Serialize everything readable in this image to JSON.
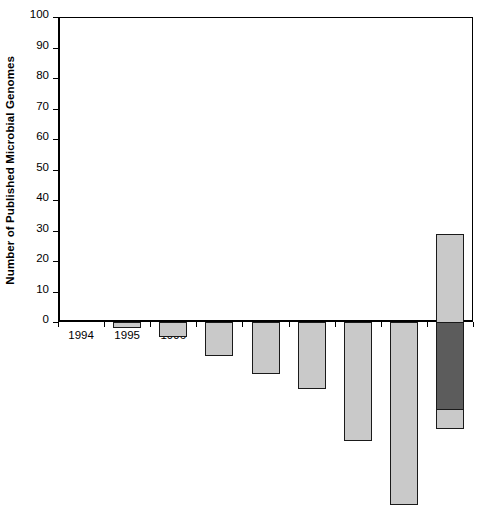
{
  "chart_data": {
    "type": "bar",
    "title": "",
    "subtitle": "",
    "xlabel": "",
    "ylabel": "Number of Published Microbial Genomes",
    "categories": [
      "1994",
      "1995",
      "1996",
      "1997",
      "1998",
      "1999",
      "2000",
      "2001",
      "2002"
    ],
    "values": [
      0,
      2,
      5,
      11,
      17,
      22,
      39,
      60,
      93
    ],
    "stacked": true,
    "series": [
      {
        "name": "lower-segment",
        "color": "#c9c9c9",
        "values": [
          0,
          2,
          5,
          11,
          17,
          22,
          39,
          60,
          64
        ]
      },
      {
        "name": "upper-segment",
        "color": "#5c5c5c",
        "values": [
          0,
          0,
          0,
          0,
          0,
          0,
          0,
          0,
          29
        ]
      }
    ],
    "ylim": [
      0,
      100
    ],
    "y_ticks": [
      0,
      10,
      20,
      30,
      40,
      50,
      60,
      70,
      80,
      90,
      100
    ],
    "y_tick_labels": [
      "0",
      "10",
      "20",
      "30",
      "40",
      "50",
      "60",
      "70",
      "80",
      "90",
      "100"
    ],
    "grid": false,
    "legend": false,
    "legend_position": "none",
    "bar_edge_color": "#1a1a1a",
    "axis_color": "#000000",
    "background_color": "#ffffff"
  }
}
